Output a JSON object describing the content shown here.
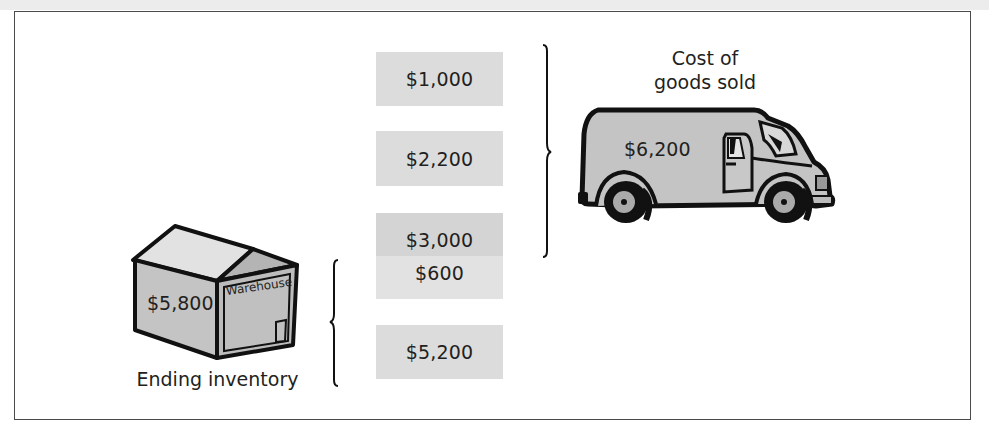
{
  "figure": {
    "type": "inventory-cost-flow-diagram",
    "colors": {
      "box_fill": "#dcdcdc",
      "box_fill_dark": "#d4d4d4",
      "box_fill_light": "#e2e2e2",
      "illustration_fill": "#c4c4c4",
      "outline": "#111111",
      "text": "#231f20"
    }
  },
  "cost_layers": [
    {
      "id": "layer-1",
      "amount": "$1,000",
      "group": "cost_of_goods_sold"
    },
    {
      "id": "layer-2",
      "amount": "$2,200",
      "group": "cost_of_goods_sold"
    },
    {
      "id": "layer-3",
      "amount": "$3,000",
      "group": "cost_of_goods_sold"
    },
    {
      "id": "layer-4",
      "amount": "$600",
      "group": "ending_inventory"
    },
    {
      "id": "layer-5",
      "amount": "$5,200",
      "group": "ending_inventory"
    }
  ],
  "cost_of_goods_sold": {
    "label_line1": "Cost of",
    "label_line2": "goods sold",
    "total": "$6,200",
    "icon": "delivery-van-icon"
  },
  "ending_inventory": {
    "label": "Ending inventory",
    "total": "$5,800",
    "sign": "Warehouse",
    "icon": "warehouse-icon"
  }
}
